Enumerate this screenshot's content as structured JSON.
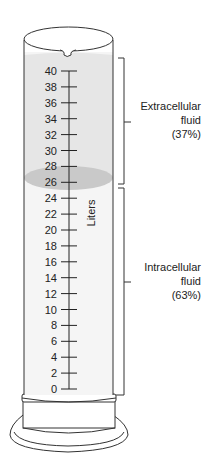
{
  "diagram": {
    "axis": {
      "label": "Liters",
      "ticks": [
        0,
        2,
        4,
        6,
        8,
        10,
        12,
        14,
        16,
        18,
        20,
        22,
        24,
        26,
        28,
        30,
        32,
        34,
        36,
        38,
        40
      ]
    },
    "compartments": [
      {
        "name": "Extracellular fluid",
        "line1": "Extracellular",
        "line2": "fluid",
        "percent": "(37%)",
        "range_liters": [
          26,
          40
        ]
      },
      {
        "name": "Intracellular fluid",
        "line1": "Intracellular",
        "line2": "fluid",
        "percent": "(63%)",
        "range_liters": [
          0,
          25
        ]
      }
    ],
    "colors": {
      "outline": "#333333",
      "extracellular_fill": "#e6e6e6",
      "intracellular_fill": "#f5f5f5",
      "boundary_band": "#c9c9c9"
    }
  }
}
